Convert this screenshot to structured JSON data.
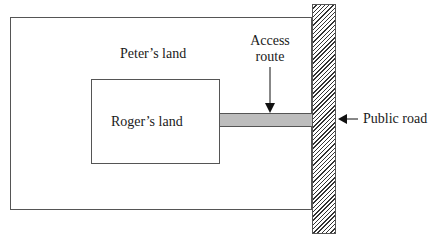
{
  "diagram": {
    "type": "land-access-schematic",
    "regions": {
      "peters_land": {
        "label": "Peter’s land"
      },
      "rogers_land": {
        "label": "Roger’s land"
      },
      "access_route": {
        "label_line1": "Access",
        "label_line2": "route",
        "fill": "#bdbdbd"
      },
      "public_road": {
        "label": "Public road",
        "fill_pattern": "diagonal-hatch"
      }
    },
    "arrows": [
      {
        "name": "access-route-arrow",
        "direction": "down",
        "target": "access_route"
      },
      {
        "name": "public-road-arrow",
        "direction": "left",
        "target": "public_road"
      }
    ],
    "colors": {
      "stroke": "#555555",
      "text": "#1a1a1a",
      "access_fill": "#bdbdbd",
      "hatch": "#333333"
    }
  }
}
